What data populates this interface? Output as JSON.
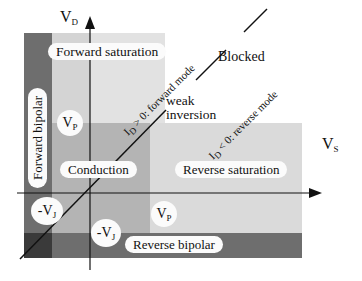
{
  "axes": {
    "vertical": {
      "name": "V",
      "subscript": "D"
    },
    "horizontal": {
      "name": "V",
      "subscript": "S"
    }
  },
  "regions": {
    "forward_saturation": "Forward saturation",
    "forward_bipolar": "Forward bipolar",
    "conduction": "Conduction",
    "reverse_saturation": "Reverse saturation",
    "reverse_bipolar": "Reverse bipolar",
    "blocked": "Blocked",
    "weak_inversion_line1": "weak",
    "weak_inversion_line2": "inversion"
  },
  "markers": {
    "vp_upper": {
      "name": "V",
      "subscript": "P"
    },
    "vp_lower": {
      "name": "V",
      "subscript": "P"
    },
    "vj_left": {
      "name": "-V",
      "subscript": "J"
    },
    "vj_lower": {
      "name": "-V",
      "subscript": "J"
    }
  },
  "diagonal_labels": {
    "forward": {
      "prefix": "I",
      "subscript": "D",
      "text": " > 0: forward mode"
    },
    "reverse": {
      "prefix": "I",
      "subscript": "D",
      "text": " < 0: reverse mode"
    }
  },
  "colors": {
    "light": "#dcdcdc",
    "lighter": "#e6e6e6",
    "medium": "#b8b8b8",
    "dark": "#6e6e6e",
    "darkest": "#3a3a3a",
    "label_bg": "#fbfbfb"
  }
}
